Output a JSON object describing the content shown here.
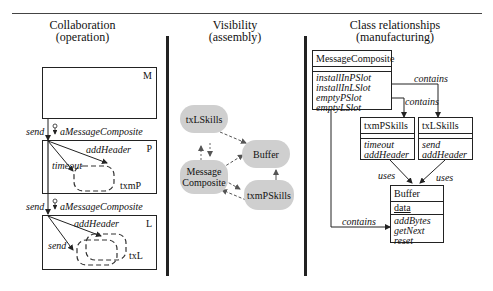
{
  "panels": [
    {
      "title": "Collaboration",
      "subtitle": "(operation)"
    },
    {
      "title": "Visibility",
      "subtitle": "(assembly)"
    },
    {
      "title": "Class relationships",
      "subtitle": "(manufacturing)"
    }
  ],
  "collaboration": {
    "box_m": {
      "label": "M"
    },
    "box_p": {
      "label": "P",
      "message1": "addHeader",
      "message2": "timeout",
      "object": "txmP"
    },
    "box_l": {
      "label": "L",
      "message1": "addHeader",
      "message2": "send",
      "object": "txL"
    },
    "link1": {
      "message": "send",
      "param": "aMessageComposite"
    },
    "link2": {
      "message": "send",
      "param": "aMessageComposite"
    }
  },
  "visibility": {
    "nodes": [
      {
        "id": "txLSkills",
        "label": "txLSkills"
      },
      {
        "id": "Buffer",
        "label": "Buffer"
      },
      {
        "id": "MessageComposite",
        "label_line1": "Message",
        "label_line2": "Composite"
      },
      {
        "id": "txmPSkills",
        "label": "txmPSkills"
      }
    ]
  },
  "classes": {
    "message_composite": {
      "name": "MessageComposite",
      "ops": [
        "installInPSlot",
        "installInLSlot",
        "emptyPSlot",
        "emptyLSlot"
      ]
    },
    "txmp_skills": {
      "name": "txmPSkills",
      "ops": [
        "timeout",
        "addHeader"
      ]
    },
    "txl_skills": {
      "name": "txLSkills",
      "ops": [
        "send",
        "addHeader"
      ]
    },
    "buffer": {
      "name": "Buffer",
      "attr": "data",
      "ops": [
        "addBytes",
        "getNext",
        "reset"
      ]
    },
    "labels": {
      "contains_top": "contains",
      "contains_mid": "contains",
      "contains_bottom": "contains",
      "uses_left": "uses",
      "uses_right": "uses"
    }
  }
}
